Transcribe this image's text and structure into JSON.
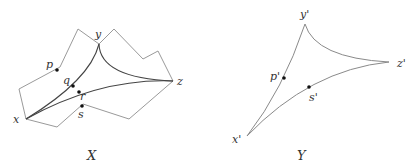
{
  "figure": {
    "left": {
      "caption": "X",
      "vertices": {
        "x": "x",
        "y": "y",
        "z": "z"
      },
      "points": {
        "p": "p",
        "q": "q",
        "r": "r",
        "s": "s"
      }
    },
    "right": {
      "caption": "Y",
      "vertices": {
        "x": "x'",
        "y": "y'",
        "z": "z'"
      },
      "points": {
        "p": "p'",
        "s": "s'"
      }
    }
  },
  "colors": {
    "outline": "#9a9a9a",
    "curve": "#555555",
    "dot": "#111111",
    "text": "#333333"
  }
}
